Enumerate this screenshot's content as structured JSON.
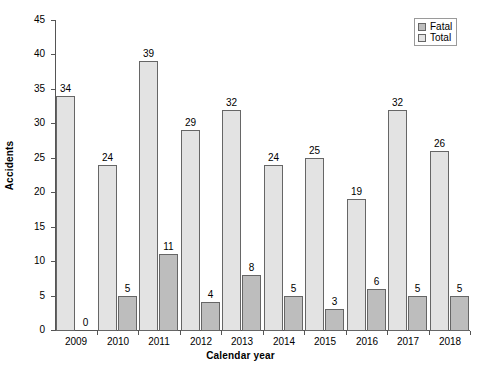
{
  "chart_data": {
    "type": "bar",
    "title": "",
    "xlabel": "Calendar year",
    "ylabel": "Accidents",
    "categories": [
      "2009",
      "2010",
      "2011",
      "2012",
      "2013",
      "2014",
      "2015",
      "2016",
      "2017",
      "2018"
    ],
    "series": [
      {
        "name": "Total",
        "color": "#e3e3e3",
        "values": [
          34,
          24,
          39,
          29,
          32,
          24,
          25,
          19,
          32,
          26
        ]
      },
      {
        "name": "Fatal",
        "color": "#bdbdbd",
        "values": [
          0,
          5,
          11,
          4,
          8,
          5,
          3,
          6,
          5,
          5
        ]
      }
    ],
    "ylim": [
      0,
      45
    ],
    "ytick_values": [
      0,
      5,
      10,
      15,
      20,
      25,
      30,
      35,
      40,
      45
    ],
    "ytick_labels": [
      "0",
      "5",
      "10",
      "15",
      "20",
      "25",
      "30",
      "35",
      "40",
      "45"
    ],
    "grid": false,
    "legend_position": "top-right",
    "legend_entries": [
      "Fatal",
      "Total"
    ],
    "data_labels_shown": true
  },
  "legend": {
    "items": [
      {
        "label": "Fatal",
        "color": "#bdbdbd"
      },
      {
        "label": "Total",
        "color": "#e3e3e3"
      }
    ]
  },
  "axes": {
    "y_title": "Accidents",
    "x_title": "Calendar year"
  }
}
